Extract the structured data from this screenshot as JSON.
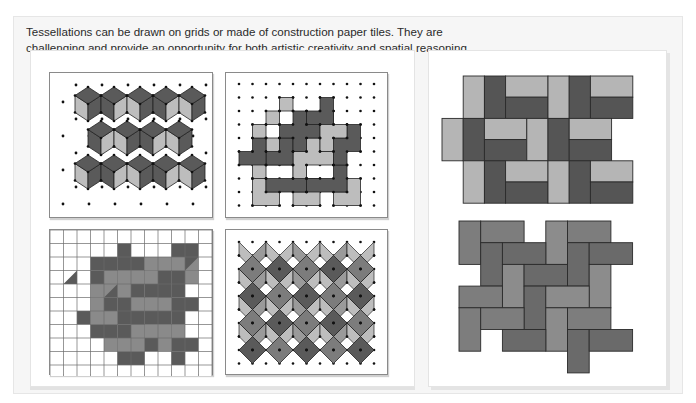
{
  "intro_text": "Tessellations can be drawn on grids or made of construction paper tiles. They are challenging and provide an opportunity for both artistic creativity and spatial reasoning.",
  "colors": {
    "dark": "#5a5a5a",
    "medium": "#8a8a8a",
    "light": "#bdbdbd",
    "line": "#222222",
    "dot": "#111111",
    "grid_line": "#6a6a6a"
  },
  "figures": [
    {
      "id": "cube-tessellation-dot-grid",
      "label": "Rhombus cube tessellation on isometric dot grid"
    },
    {
      "id": "polyomino-tessellation-dot-grid",
      "label": "L-shaped polyomino tessellation on square dot grid"
    },
    {
      "id": "parallelogram-tessellation-square-grid",
      "label": "Sheared block tessellation on square grid"
    },
    {
      "id": "diamond-tessellation-dot-grid",
      "label": "Diamond and kite tessellation on dot grid"
    },
    {
      "id": "rectangle-tile-pattern",
      "label": "Construction paper rectangle tile pattern"
    },
    {
      "id": "basketweave-tile-pattern",
      "label": "Construction paper basketweave tile pattern"
    }
  ]
}
